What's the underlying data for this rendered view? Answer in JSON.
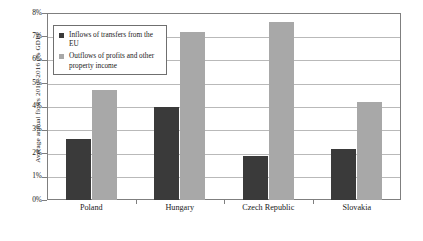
{
  "chart_data": {
    "type": "bar",
    "title": "",
    "xlabel": "",
    "ylabel": "Average annual flows 2010–2016 (% GDP)",
    "ylim": [
      0,
      8
    ],
    "ytick_labels": [
      "8%",
      "7%",
      "6%",
      "5%",
      "4%",
      "3%",
      "2%",
      "1%",
      "0%"
    ],
    "ytick_values": [
      8,
      7,
      6,
      5,
      4,
      3,
      2,
      1,
      0
    ],
    "grid": true,
    "legend_position": "top-left inside plot",
    "categories": [
      "Poland",
      "Hungary",
      "Czech Republic",
      "Slovakia"
    ],
    "series": [
      {
        "name": "Inflows of transfers from the EU",
        "color": "#3a3a3a",
        "values": [
          2.6,
          4.0,
          1.9,
          2.2
        ]
      },
      {
        "name": "Outflows of profits and other property income",
        "color": "#a8a8a8",
        "values": [
          4.7,
          7.2,
          7.6,
          4.2
        ]
      }
    ]
  }
}
